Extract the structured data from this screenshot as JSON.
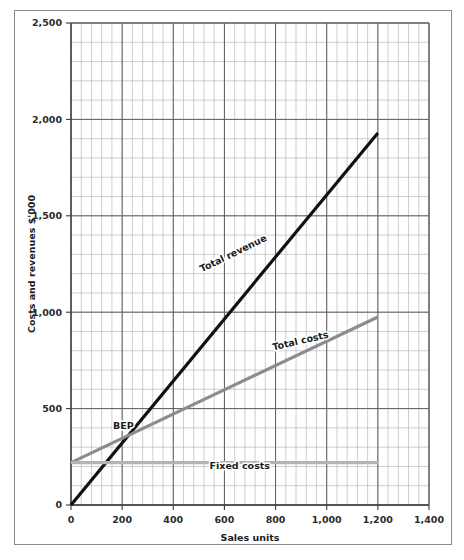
{
  "chart_data": {
    "type": "line",
    "title": "",
    "xlabel": "Sales units",
    "ylabel": "Costs and revenues $'000",
    "xlim": [
      0,
      1400
    ],
    "ylim": [
      0,
      2500
    ],
    "xticks": [
      0,
      200,
      400,
      600,
      800,
      1000,
      1200,
      1400
    ],
    "xtick_labels": [
      "0",
      "200",
      "400",
      "600",
      "800",
      "1,000",
      "1,200",
      "1,400"
    ],
    "yticks": [
      0,
      500,
      1000,
      1500,
      2000,
      2500
    ],
    "ytick_labels": [
      "0",
      "500",
      "1,000",
      "1,500",
      "2,000",
      "2,500"
    ],
    "grid": true,
    "grid_minor_step_x": 40,
    "grid_minor_step_y": 100,
    "legend_position": "inline-annotations",
    "series": [
      {
        "name": "Total revenue",
        "color": "#111111",
        "width": 3.2,
        "x": [
          0,
          1200
        ],
        "values": [
          0,
          1930
        ]
      },
      {
        "name": "Total costs",
        "color": "#8c8c8c",
        "width": 3.2,
        "x": [
          0,
          1200
        ],
        "values": [
          220,
          975
        ]
      },
      {
        "name": "Fixed costs",
        "color": "#b4b4b4",
        "width": 3.2,
        "x": [
          0,
          1200
        ],
        "values": [
          220,
          220
        ]
      }
    ],
    "annotations": [
      {
        "text": "Total revenue",
        "x": 640,
        "y": 1290,
        "rotation": -26
      },
      {
        "text": "Total costs",
        "x": 900,
        "y": 835,
        "rotation": -13
      },
      {
        "text": "Fixed costs",
        "x": 660,
        "y": 185,
        "rotation": 0
      },
      {
        "text": "BEP",
        "x": 205,
        "y": 395,
        "rotation": 0
      }
    ],
    "breakeven_point": {
      "x": 230,
      "y": 360,
      "label": "BEP"
    }
  }
}
